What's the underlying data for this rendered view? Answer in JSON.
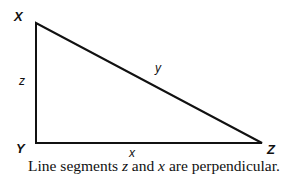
{
  "diagram": {
    "type": "right-triangle",
    "vertices": [
      {
        "name": "X",
        "x": 36,
        "y": 23
      },
      {
        "name": "Y",
        "x": 36,
        "y": 143
      },
      {
        "name": "Z",
        "x": 262,
        "y": 143
      }
    ],
    "sides": [
      {
        "name": "z",
        "from": "X",
        "to": "Y"
      },
      {
        "name": "x",
        "from": "Y",
        "to": "Z"
      },
      {
        "name": "y",
        "from": "X",
        "to": "Z"
      }
    ],
    "labels": {
      "vertex_x": "X",
      "vertex_y": "Y",
      "vertex_z": "Z",
      "side_z": "z",
      "side_x": "x",
      "side_y": "y"
    },
    "caption": {
      "prefix": "Line segments ",
      "var1": "z",
      "mid": " and ",
      "var2": "x",
      "suffix": " are perpendicular."
    },
    "line_color": "#111111"
  }
}
